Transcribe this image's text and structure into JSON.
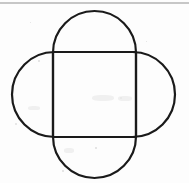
{
  "figure": {
    "background_color": "#fdfdfd",
    "stroke_color": "#1a1a1a",
    "stroke_width": 2.2,
    "canvas": {
      "width": 189,
      "height": 183
    },
    "square": {
      "name": "central-square",
      "x": 53,
      "y": 52,
      "width": 83,
      "height": 85
    },
    "vertical_capsule": {
      "name": "vertical-stadium",
      "x": 53,
      "y": 11,
      "width": 83,
      "height": 167,
      "corner_radius": 41.5
    },
    "horizontal_capsule": {
      "name": "horizontal-stadium",
      "x": 12,
      "y": 52,
      "width": 163,
      "height": 85,
      "corner_radius": 42.5
    },
    "scan_line": {
      "name": "scan-artifact-line",
      "y": 3,
      "color": "#b4b4b4",
      "thickness": 1.4
    },
    "specks": [
      {
        "x": 15,
        "y": 123,
        "size": 2
      },
      {
        "x": 38,
        "y": 60,
        "size": 1.5
      },
      {
        "x": 62,
        "y": 170,
        "size": 1.6
      },
      {
        "x": 120,
        "y": 97,
        "size": 1.8
      },
      {
        "x": 146,
        "y": 41,
        "size": 1.4
      },
      {
        "x": 95,
        "y": 147,
        "size": 1.5
      },
      {
        "x": 30,
        "y": 22,
        "size": 1.3
      }
    ],
    "smudges": [
      {
        "x": 92,
        "y": 95,
        "w": 22,
        "h": 6
      },
      {
        "x": 118,
        "y": 96,
        "w": 14,
        "h": 5
      },
      {
        "x": 64,
        "y": 148,
        "w": 10,
        "h": 5
      },
      {
        "x": 28,
        "y": 106,
        "w": 12,
        "h": 4
      }
    ]
  }
}
